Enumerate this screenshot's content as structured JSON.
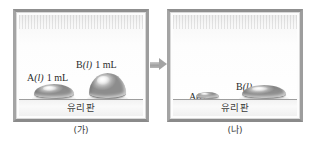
{
  "diagram": {
    "panels": [
      {
        "id": "before",
        "caption": "(가)",
        "plate_label": "유리판",
        "droplets": [
          {
            "id": "a-before",
            "substance": "A",
            "state": "(l)",
            "volume": "1 mL",
            "shape": "flat-wide-dome"
          },
          {
            "id": "b-before",
            "substance": "B",
            "state": "(l)",
            "volume": "1 mL",
            "shape": "tall-round-dome"
          }
        ]
      },
      {
        "id": "after",
        "caption": "(나)",
        "plate_label": "유리판",
        "droplets": [
          {
            "id": "a-after",
            "substance": "A",
            "state": "(l)",
            "volume": "",
            "shape": "very-small-flat-dome"
          },
          {
            "id": "b-after",
            "substance": "B",
            "state": "(l)",
            "volume": "",
            "shape": "wide-flat-dome"
          }
        ]
      }
    ],
    "arrow": {
      "icon": "arrow-right-icon",
      "direction": "right"
    },
    "colors": {
      "frame": "#9a9a9a",
      "droplet_light": "#ffffff",
      "droplet_mid": "#cfcfcf",
      "droplet_dark": "#8d8d8d",
      "plate": "#f5f5f5",
      "arrow": "#a3a3a3",
      "text": "#2b2b2b",
      "background": "#ffffff"
    }
  }
}
